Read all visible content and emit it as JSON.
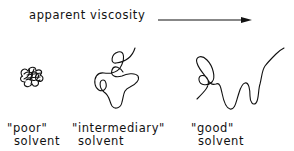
{
  "header": {
    "axis_label": "apparent viscosity",
    "arrow_direction": "right"
  },
  "coils": [
    {
      "id": "poor",
      "quality": "\"poor\"",
      "solvent": "solvent",
      "shape": "tight-ball"
    },
    {
      "id": "intermediary",
      "quality": "\"intermediary\"",
      "solvent": "solvent",
      "shape": "loose-coil"
    },
    {
      "id": "good",
      "quality": "\"good\"",
      "solvent": "solvent",
      "shape": "extended-chain"
    }
  ],
  "colors": {
    "line": "#111111",
    "background": "#ffffff"
  }
}
